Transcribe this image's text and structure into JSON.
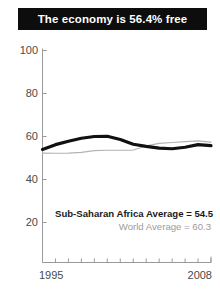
{
  "title": {
    "text": "The economy is 56.4% free"
  },
  "colors": {
    "banner_bg": "#0d0d0d",
    "banner_text": "#ffffff",
    "africa_line": "#111111",
    "world_line": "#b3b3b3",
    "axis": "#9a9a9a",
    "tick_text": "#4a4a4a",
    "legend_world_text": "#9b9b9b"
  },
  "annotations": {
    "africa_average": "Sub-Saharan Africa Average = 54.5",
    "world_average": "World Average = 60.3"
  },
  "axes": {
    "y_ticks": [
      "100",
      "80",
      "60",
      "40",
      "20"
    ],
    "x_start": "1995",
    "x_end": "2008"
  },
  "chart_data": {
    "type": "line",
    "title": "The economy is 56.4% free",
    "xlabel": "",
    "ylabel": "",
    "xlim": [
      1995,
      2008
    ],
    "ylim": [
      0,
      100
    ],
    "ytick_values": [
      20,
      40,
      60,
      80,
      100
    ],
    "xtick_values": [
      1995,
      1996,
      1997,
      1998,
      1999,
      2000,
      2001,
      2002,
      2003,
      2004,
      2005,
      2006,
      2007,
      2008
    ],
    "xtick_labels_shown": [
      "1995",
      "2008"
    ],
    "grid": false,
    "legend_position": "inside-lower-right",
    "x": [
      1995,
      1996,
      1997,
      1998,
      1999,
      2000,
      2001,
      2002,
      2003,
      2004,
      2005,
      2006,
      2007,
      2008
    ],
    "series": [
      {
        "name": "Sub-Saharan Africa",
        "color": "#111111",
        "linewidth": 3.2,
        "values": [
          54.0,
          56.2,
          57.8,
          59.2,
          60.0,
          60.1,
          58.6,
          56.4,
          55.4,
          54.6,
          54.3,
          55.0,
          56.2,
          55.8
        ],
        "annotation": "Sub-Saharan Africa Average = 54.5",
        "average": 54.5
      },
      {
        "name": "World",
        "color": "#b3b3b3",
        "linewidth": 1.2,
        "values": [
          52.3,
          52.2,
          52.3,
          52.6,
          53.4,
          53.6,
          53.6,
          53.7,
          55.6,
          56.8,
          57.2,
          57.6,
          58.0,
          57.4
        ],
        "annotation": "World Average = 60.3",
        "average": 60.3
      }
    ]
  }
}
